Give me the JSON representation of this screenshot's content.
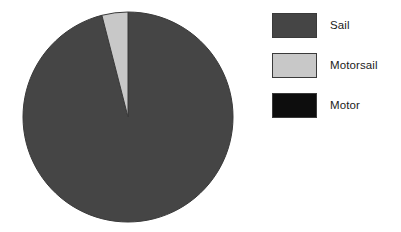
{
  "chart_data": {
    "type": "pie",
    "title": "",
    "subtitle": "",
    "xlabel": "",
    "ylabel": "",
    "grid": false,
    "legend_position": "right",
    "start_angle_deg": 0,
    "direction": "clockwise",
    "categories": [
      "Sail",
      "Motorsail",
      "Motor"
    ],
    "values": [
      96,
      4,
      0
    ],
    "units": "percent",
    "slices": [
      {
        "label": "Sail",
        "value": 96,
        "percent": 96,
        "angle_deg": 345.6,
        "color": "#454545"
      },
      {
        "label": "Motorsail",
        "value": 4,
        "percent": 4,
        "angle_deg": 14.4,
        "color": "#c8c8c8"
      },
      {
        "label": "Motor",
        "value": 0,
        "percent": 0,
        "angle_deg": 0,
        "color": "#0d0d0d"
      }
    ]
  },
  "geometry": {
    "center_x": 128,
    "center_y": 117,
    "radius": 105
  },
  "colors": {
    "background": "#ffffff",
    "sail": "#454545",
    "motorsail": "#c8c8c8",
    "motor": "#0d0d0d",
    "outline": "#3a3a3a",
    "text": "#1b1b1b"
  },
  "legend": {
    "items": [
      {
        "label": "Sail",
        "color": "#454545",
        "swatch_name": "legend-swatch-sail"
      },
      {
        "label": "Motorsail",
        "color": "#c8c8c8",
        "swatch_name": "legend-swatch-motorsail"
      },
      {
        "label": "Motor",
        "color": "#0d0d0d",
        "swatch_name": "legend-swatch-motor"
      }
    ]
  }
}
